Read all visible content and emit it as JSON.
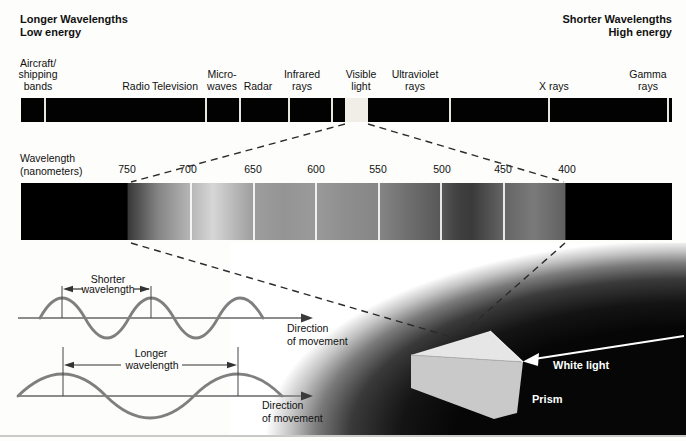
{
  "header": {
    "left": [
      "Longer Wavelengths",
      "Low energy"
    ],
    "right": [
      "Shorter Wavelengths",
      "High energy"
    ]
  },
  "em_bar": {
    "bands": [
      {
        "lines": [
          "Aircraft/",
          "shipping",
          "bands"
        ]
      },
      {
        "lines": [
          "Radio"
        ]
      },
      {
        "lines": [
          "Television"
        ]
      },
      {
        "lines": [
          "Micro-",
          "waves"
        ]
      },
      {
        "lines": [
          "Radar"
        ]
      },
      {
        "lines": [
          "Infrared",
          "rays"
        ]
      },
      {
        "lines": [
          "Visible",
          "light"
        ]
      },
      {
        "lines": [
          "Ultraviolet",
          "rays"
        ]
      },
      {
        "lines": [
          "X rays"
        ]
      },
      {
        "lines": [
          "Gamma",
          "rays"
        ]
      }
    ]
  },
  "wavelength_scale": {
    "label": [
      "Wavelength",
      "(nanometers)"
    ],
    "ticks": [
      "750",
      "700",
      "650",
      "600",
      "550",
      "500",
      "450",
      "400"
    ]
  },
  "waves": {
    "shorter": {
      "name": "Shorter",
      "measure": "wavelength",
      "direction": [
        "Direction",
        "of movement"
      ]
    },
    "longer": {
      "name": "Longer",
      "measure": "wavelength",
      "direction": [
        "Direction",
        "of movement"
      ]
    }
  },
  "prism_scene": {
    "incoming_ray": "White light",
    "object": "Prism"
  },
  "colors": {
    "bar_black": "#020202",
    "visible_gap": "#f1eee8",
    "wave_stroke": "#7f7f7f",
    "dash_stroke": "#2b2b2b",
    "photo_dark": "#060606",
    "prism_top": "#e6e6e6",
    "prism_front": "#c9c9c9",
    "text": "#111111"
  }
}
